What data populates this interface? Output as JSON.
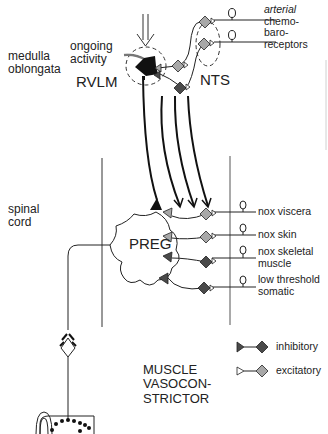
{
  "regions": {
    "medulla": "medulla\noblongata",
    "medulla_line1": "medulla",
    "medulla_line2": "oblongata",
    "spinal_line1": "spinal",
    "spinal_line2": "cord"
  },
  "nuclei": {
    "ongoing_line1": "ongoing",
    "ongoing_line2": "activity",
    "rvlm": "RVLM",
    "nts": "NTS",
    "preg": "PREG"
  },
  "receptors": {
    "line1": "arterial",
    "line2": "chemo-",
    "line3": "baro-",
    "line4": "receptors"
  },
  "afferents": [
    {
      "line1": "nox viscera",
      "line2": ""
    },
    {
      "line1": "nox skin",
      "line2": ""
    },
    {
      "line1": "nox skeletal",
      "line2": "muscle"
    },
    {
      "line1": "low threshold",
      "line2": "somatic"
    }
  ],
  "pathway_title": {
    "line1": "MUSCLE",
    "line2": "VASOCON-",
    "line3": "STRICTOR"
  },
  "legend": [
    {
      "label": "inhibitory",
      "color": "#555555"
    },
    {
      "label": "excitatory",
      "color": "#aaaaaa"
    }
  ],
  "colors": {
    "line": "#1a1a1a",
    "inhibitory": "#4a4a4a",
    "excitatory": "#a8a8a8",
    "rvlm_neuron": "#111111"
  }
}
